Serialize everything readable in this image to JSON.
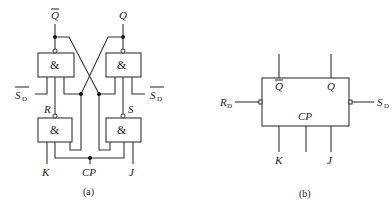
{
  "diagram": {
    "colors": {
      "line": "#333333",
      "background": "#ffffff",
      "text": "#222222"
    },
    "panel_a": {
      "caption": "(a)",
      "gates": [
        {
          "id": "g_top_left",
          "symbol": "&",
          "output": "Q̄"
        },
        {
          "id": "g_top_right",
          "symbol": "&",
          "output": "Q"
        },
        {
          "id": "g_bot_left",
          "symbol": "&",
          "output": "R"
        },
        {
          "id": "g_bot_right",
          "symbol": "&",
          "output": "S"
        }
      ],
      "labels": {
        "qbar": "Q",
        "q": "Q",
        "sd_left": "S",
        "sd_left_sub": "D",
        "sd_right": "S",
        "sd_right_sub": "D",
        "r": "R",
        "s": "S",
        "k": "K",
        "cp": "CP",
        "j": "J"
      }
    },
    "panel_b": {
      "caption": "(b)",
      "labels": {
        "qbar": "Q",
        "q": "Q",
        "rd": "R",
        "rd_sub": "D",
        "sd": "S",
        "sd_sub": "D",
        "cp": "CP",
        "k": "K",
        "j": "J"
      }
    }
  }
}
